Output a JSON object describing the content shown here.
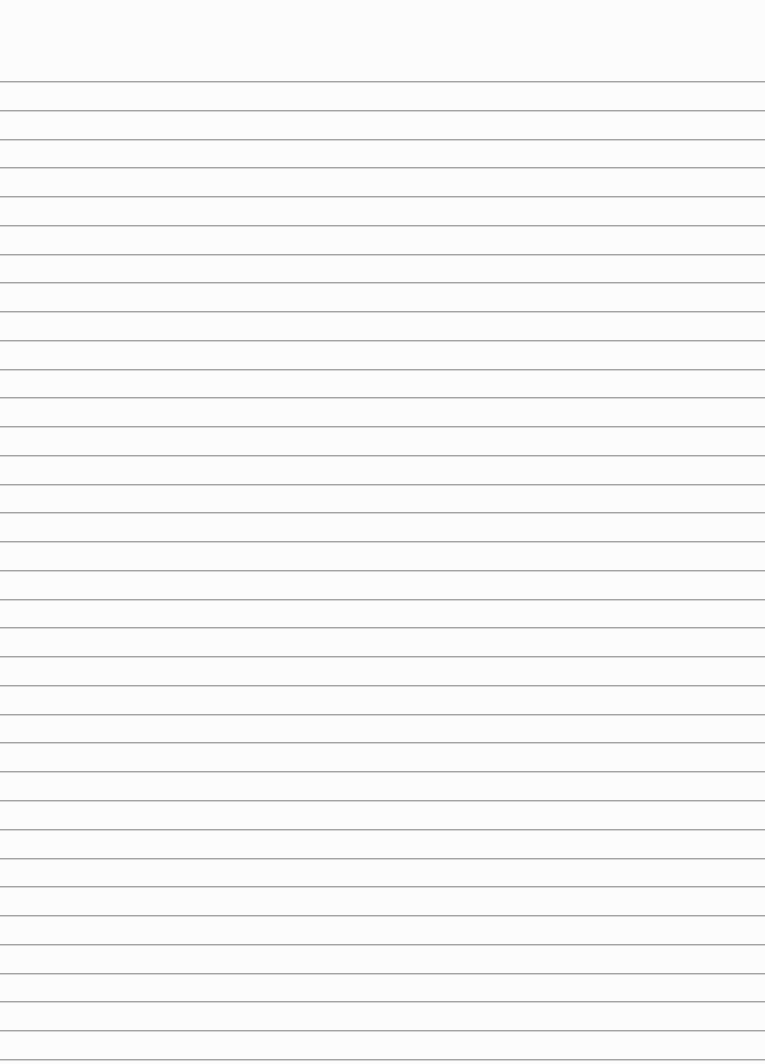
{
  "paper": {
    "type": "lined-notebook-paper",
    "background_color": "#fcfcfc",
    "line_color": "#a3a3a3",
    "line_count": 35,
    "first_line_y": 81,
    "line_spacing": 28.76,
    "text": ""
  }
}
